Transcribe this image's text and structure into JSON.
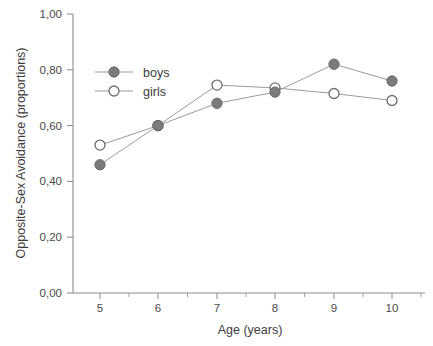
{
  "chart_data": {
    "type": "line",
    "title": "",
    "xlabel": "Age (years)",
    "ylabel": "Opposite-Sex Avoidance (proportions)",
    "x": [
      5,
      6,
      7,
      8,
      9,
      10
    ],
    "categories": [
      "5",
      "6",
      "7",
      "8",
      "9",
      "10"
    ],
    "xlim": [
      4.5,
      10.7
    ],
    "ylim": [
      0.0,
      1.0
    ],
    "y_ticks": [
      0.0,
      0.2,
      0.4,
      0.6,
      0.8,
      1.0
    ],
    "y_tick_labels": [
      "0,00",
      "0,20",
      "0,40",
      "0,60",
      "0,80",
      "1,00"
    ],
    "x_tick_labels": [
      "5",
      "6",
      "7",
      "8",
      "9",
      "10"
    ],
    "grid": false,
    "legend_position": "upper left inside",
    "series": [
      {
        "name": "boys",
        "marker": "filled-circle",
        "color": "#7b7b7b",
        "values": [
          0.46,
          0.6,
          0.68,
          0.72,
          0.82,
          0.76
        ]
      },
      {
        "name": "girls",
        "marker": "open-circle",
        "color": "#ffffff",
        "values": [
          0.53,
          0.6,
          0.745,
          0.735,
          0.715,
          0.69
        ]
      }
    ]
  },
  "axes": {
    "x_title": "Age (years)",
    "y_title": "Opposite-Sex Avoidance (proportions)",
    "y_labels": [
      "1,00",
      "0,80",
      "0,60",
      "0,40",
      "0,20",
      "0,00"
    ],
    "x_labels": [
      "5",
      "6",
      "7",
      "8",
      "9",
      "10"
    ]
  },
  "legend": {
    "entries": [
      {
        "label": "boys",
        "marker": "filled-circle"
      },
      {
        "label": "girls",
        "marker": "open-circle"
      }
    ]
  },
  "colors": {
    "axis": "#8d8d8d",
    "line": "#9b9b9b",
    "boys_marker": "#7b7b7b",
    "girls_marker_fill": "#ffffff",
    "girls_marker_stroke": "#6e6e6e",
    "text": "#3d3d3d",
    "background": "#ffffff"
  }
}
